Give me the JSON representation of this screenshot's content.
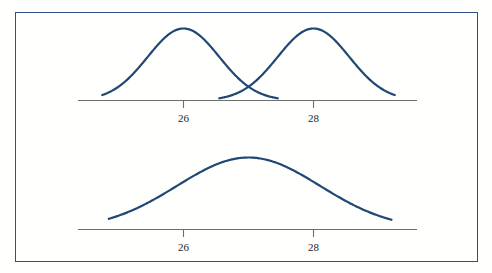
{
  "figure": {
    "background_color": "#fffffe",
    "border_color": "#2d5085",
    "curve_color": "#1f4874",
    "axis_color": "#6e6e6e",
    "label_color": "#262626"
  },
  "chart_data": [
    {
      "type": "line",
      "title": "",
      "subtitle": "",
      "xlabel": "",
      "ylabel": "",
      "panel": "top",
      "grid": false,
      "legend": "none",
      "xlim": [
        24.7,
        29.3
      ],
      "ylim": [
        0,
        1
      ],
      "tick_labels": [
        "26",
        "28"
      ],
      "tick_values": [
        26,
        28
      ],
      "series": [
        {
          "name": "distribution-left",
          "distribution": "normal",
          "mean": 26,
          "std_dev": 0.55,
          "peak_x": 26,
          "peak_y": 1.0,
          "x_start": 24.75,
          "x_end": 27.45
        },
        {
          "name": "distribution-right",
          "distribution": "normal",
          "mean": 28,
          "std_dev": 0.55,
          "peak_x": 28,
          "peak_y": 1.0,
          "x_start": 26.55,
          "x_end": 29.25
        }
      ]
    },
    {
      "type": "line",
      "title": "",
      "subtitle": "",
      "xlabel": "",
      "ylabel": "",
      "panel": "bottom",
      "grid": false,
      "legend": "none",
      "xlim": [
        24.7,
        29.3
      ],
      "ylim": [
        0,
        1
      ],
      "tick_labels": [
        "26",
        "28"
      ],
      "tick_values": [
        26,
        28
      ],
      "series": [
        {
          "name": "distribution-combined",
          "distribution": "normal",
          "mean": 27,
          "std_dev": 1.1,
          "peak_x": 27,
          "peak_y": 1.0,
          "x_start": 24.85,
          "x_end": 29.2
        }
      ]
    }
  ],
  "panels": {
    "top": {
      "name": "top-panel",
      "tick_labels": [
        "26",
        "28"
      ]
    },
    "bottom": {
      "name": "bottom-panel",
      "tick_labels": [
        "26",
        "28"
      ]
    }
  }
}
